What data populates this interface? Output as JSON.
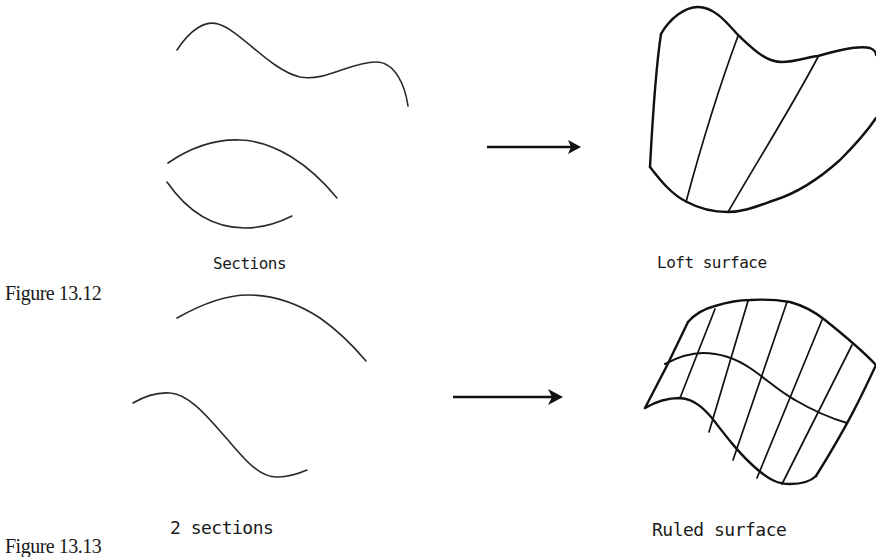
{
  "figure_13_12": {
    "caption": "Figure 13.12",
    "input_label": "Sections",
    "output_label": "Loft surface",
    "input_curve_count": 3,
    "arrow": "arrow-right-icon"
  },
  "figure_13_13": {
    "caption": "Figure 13.13",
    "input_label": "2 sections",
    "output_label": "Ruled surface",
    "input_curve_count": 2,
    "arrow": "arrow-right-icon"
  },
  "colors": {
    "ink": "#111111",
    "background": "#ffffff"
  }
}
